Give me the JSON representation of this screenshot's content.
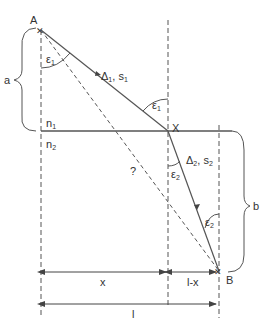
{
  "diagram": {
    "points": {
      "A": "A",
      "X": "X",
      "B": "B"
    },
    "media": {
      "upper": "n",
      "upper_sub": "1",
      "lower": "n",
      "lower_sub": "2"
    },
    "angles": {
      "eps": "ε",
      "eps1_sub": "1",
      "eps2_sub": "2"
    },
    "segments": {
      "seg1_label": "Δ",
      "seg1_sub": "1",
      "seg1_s": ", s",
      "seg1_s_sub": "1",
      "seg2_label": "Δ",
      "seg2_sub": "2",
      "seg2_s": ", s",
      "seg2_s_sub": "2",
      "direct_path": "?"
    },
    "dimensions": {
      "a": "a",
      "b": "b",
      "x": "x",
      "l_minus_x": "l-x",
      "l": "l"
    },
    "colors": {
      "line": "#555555",
      "text": "#333333"
    }
  }
}
